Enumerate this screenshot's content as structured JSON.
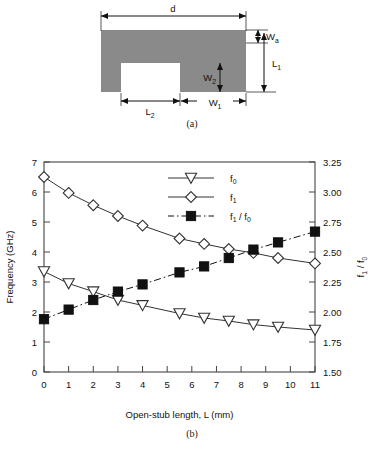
{
  "figure": {
    "panel_a": {
      "caption": "(a)",
      "shape_fill": "#8a8a8a",
      "dimension_labels": [
        {
          "id": "d",
          "base": "d",
          "sub": ""
        },
        {
          "id": "Wa",
          "base": "W",
          "sub": "a"
        },
        {
          "id": "L1",
          "base": "L",
          "sub": "1"
        },
        {
          "id": "W2",
          "base": "W",
          "sub": "2"
        },
        {
          "id": "L2",
          "base": "L",
          "sub": "2"
        },
        {
          "id": "W1",
          "base": "W",
          "sub": "1"
        }
      ]
    },
    "panel_b": {
      "caption": "(b)"
    }
  },
  "chart_data": {
    "type": "line",
    "title": "",
    "xlabel": "Open-stub length, L (mm)",
    "ylabel_left": "Frequency (GHz)",
    "ylabel_right_base": "f",
    "ylabel_right_sub1": "1",
    "ylabel_right_div": " / f",
    "ylabel_right_sub2": "0",
    "ylabel_right": "f1 / f0",
    "grid": false,
    "legend_position": "top-center",
    "xlim": [
      0,
      11
    ],
    "xticks": [
      0,
      1,
      2,
      3,
      4,
      5,
      6,
      7,
      8,
      9,
      10,
      11
    ],
    "xtick_labels": [
      "0",
      "1",
      "2",
      "3",
      "4",
      "5",
      "6",
      "7",
      "8",
      "9",
      "10",
      "11"
    ],
    "ylim_left": [
      0,
      7
    ],
    "yticks_left": [
      0,
      1,
      2,
      3,
      4,
      5,
      6,
      7
    ],
    "ytick_labels_left": [
      "0",
      "1",
      "2",
      "3",
      "4",
      "5",
      "6",
      "7"
    ],
    "ylim_right": [
      1.5,
      3.25
    ],
    "yticks_right": [
      1.5,
      1.75,
      2.0,
      2.25,
      2.5,
      2.75,
      3.0,
      3.25
    ],
    "ytick_labels_right": [
      "1.50",
      "1.75",
      "2.00",
      "2.25",
      "2.50",
      "2.75",
      "3.00",
      "3.25"
    ],
    "series": [
      {
        "name": "f0",
        "legend_base": "f",
        "legend_sub": "0",
        "axis": "left",
        "marker": "triangle-down-open",
        "linestyle": "solid",
        "color": "#333333",
        "x": [
          0,
          1,
          2,
          3,
          4,
          5.5,
          6.5,
          7.5,
          8.5,
          9.5,
          11
        ],
        "y": [
          3.35,
          2.95,
          2.68,
          2.4,
          2.22,
          1.95,
          1.8,
          1.7,
          1.58,
          1.5,
          1.4
        ]
      },
      {
        "name": "f1",
        "legend_base": "f",
        "legend_sub": "1",
        "axis": "left",
        "marker": "diamond-open",
        "linestyle": "solid",
        "color": "#333333",
        "x": [
          0,
          1,
          2,
          3,
          4,
          5.5,
          6.5,
          7.5,
          8.5,
          9.5,
          11
        ],
        "y": [
          6.5,
          5.97,
          5.56,
          5.2,
          4.88,
          4.45,
          4.27,
          4.1,
          3.97,
          3.8,
          3.62
        ]
      },
      {
        "name": "f1/f0",
        "legend_base": "f",
        "legend_sub": "1",
        "legend_div": " / f",
        "legend_sub2": "0",
        "axis": "right",
        "marker": "square-filled",
        "linestyle": "dashdot",
        "color": "#111111",
        "x": [
          0,
          1,
          2,
          3,
          4,
          5.5,
          6.5,
          7.5,
          8.5,
          9.5,
          11
        ],
        "y": [
          1.94,
          2.02,
          2.1,
          2.17,
          2.23,
          2.33,
          2.38,
          2.45,
          2.52,
          2.58,
          2.67
        ]
      }
    ]
  }
}
